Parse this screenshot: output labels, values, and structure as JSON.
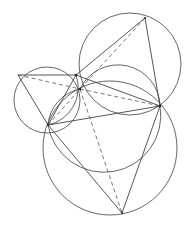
{
  "diagram": {
    "type": "geometry-figure",
    "points": {
      "T": [
        145,
        18
      ],
      "R": [
        160,
        106
      ],
      "B": [
        122,
        213
      ],
      "L": [
        18,
        75
      ],
      "M": [
        48,
        125
      ],
      "A": [
        76,
        75
      ],
      "P": [
        80,
        89
      ]
    },
    "circles": [
      {
        "name": "left-circle",
        "cx": 47,
        "cy": 100,
        "r": 32
      },
      {
        "name": "top-right-circle",
        "cx": 130,
        "cy": 64,
        "r": 51
      },
      {
        "name": "bottom-circle",
        "cx": 111,
        "cy": 148,
        "r": 66
      },
      {
        "name": "middle-circle",
        "cx": 118,
        "cy": 98,
        "r": 38
      }
    ]
  }
}
